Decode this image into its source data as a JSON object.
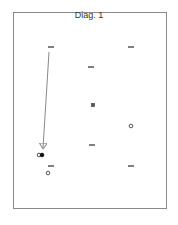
{
  "diagram": {
    "title": "Diag. 1",
    "colors": {
      "frame": "#8a8a8a",
      "marker": "#555555",
      "arrow": "#888888",
      "filled": "#111111",
      "background": "#ffffff"
    },
    "dashes": [
      {
        "x": 51,
        "y": 47
      },
      {
        "x": 131,
        "y": 47
      },
      {
        "x": 91,
        "y": 67
      },
      {
        "x": 92,
        "y": 145
      },
      {
        "x": 131,
        "y": 166
      },
      {
        "x": 51,
        "y": 166
      }
    ],
    "squares": [
      {
        "x": 93,
        "y": 105,
        "filled": true
      }
    ],
    "circles": [
      {
        "x": 131,
        "y": 126,
        "filled": false
      },
      {
        "x": 39,
        "y": 155,
        "filled": false
      },
      {
        "x": 42,
        "y": 155,
        "filled": true
      },
      {
        "x": 48,
        "y": 173,
        "filled": false
      }
    ],
    "arrows": [
      {
        "x1": 49,
        "y1": 52,
        "x2": 43,
        "y2": 148
      }
    ]
  }
}
